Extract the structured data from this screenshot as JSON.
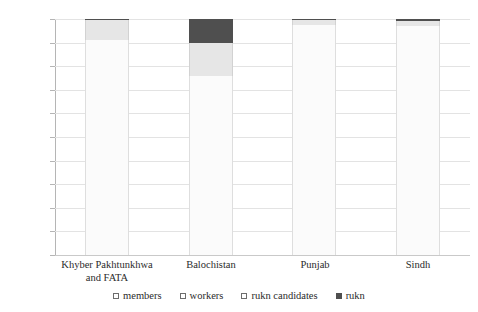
{
  "chart_data": {
    "type": "bar",
    "subtype": "stacked-100-percent",
    "title": "",
    "subtitle": "",
    "xlabel": "",
    "ylabel": "",
    "ylim": [
      0,
      100
    ],
    "y_tick_labels": [
      "100%",
      "90%",
      "80%",
      "70%",
      "60%",
      "50%",
      "40%",
      "30%",
      "20%",
      "10%",
      "0%"
    ],
    "y_tick_values": [
      100,
      90,
      80,
      70,
      60,
      50,
      40,
      30,
      20,
      10,
      0
    ],
    "grid": true,
    "legend_position": "bottom",
    "categories": [
      "Khyber Pakhtunkhwa and FATA",
      "Balochistan",
      "Punjab",
      "Sindh"
    ],
    "category_labels": [
      [
        "Khyber Pakhtunkhwa",
        "and FATA"
      ],
      [
        "Balochistan"
      ],
      [
        "Punjab"
      ],
      [
        "Sindh"
      ]
    ],
    "series": [
      {
        "name": "members",
        "color": "#fbfbfb",
        "values": [
          91.0,
          76.0,
          97.5,
          97.0
        ]
      },
      {
        "name": "workers",
        "color": "#f3f3f3",
        "values": [
          0.0,
          0.0,
          0.0,
          0.0
        ]
      },
      {
        "name": "rukn candidates",
        "color": "#e6e6e6",
        "values": [
          8.5,
          14.0,
          2.0,
          2.3
        ]
      },
      {
        "name": "rukn",
        "color": "#4f4f4f",
        "values": [
          0.5,
          10.0,
          0.5,
          0.7
        ]
      }
    ]
  },
  "legend": {
    "items": [
      {
        "label": "members",
        "filled": false
      },
      {
        "label": "workers",
        "filled": false
      },
      {
        "label": "rukn candidates",
        "filled": false
      },
      {
        "label": "rukn",
        "filled": true
      }
    ]
  },
  "colors": {
    "members": "#fbfbfb",
    "workers": "#f3f3f3",
    "rukn_candidates": "#e6e6e6",
    "rukn": "#4f4f4f",
    "gridline": "#e3e3e3",
    "axis": "#b5b5b5",
    "text": "#2b2b2b"
  }
}
